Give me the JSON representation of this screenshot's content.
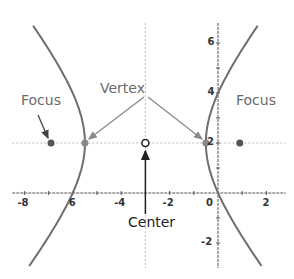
{
  "diagram": {
    "equation": {
      "h": -3,
      "k": 2,
      "a": 2.5,
      "b": 3,
      "orientation": "horizontal"
    },
    "axes": {
      "x_ticks": [
        {
          "value": -8,
          "label": "-8"
        },
        {
          "value": -6,
          "label": "6"
        },
        {
          "value": -4,
          "label": "-4"
        },
        {
          "value": -2,
          "label": "-2"
        },
        {
          "value": 0,
          "label": "0"
        },
        {
          "value": 2,
          "label": "2"
        }
      ],
      "y_ticks": [
        {
          "value": 6,
          "label": "6"
        },
        {
          "value": 4,
          "label": "4"
        },
        {
          "value": 2,
          "label": "2"
        },
        {
          "value": -2,
          "label": "-2"
        }
      ],
      "x_range": [
        -8.5,
        2.8
      ],
      "y_range": [
        -3.0,
        6.8
      ]
    },
    "points": {
      "focus_left": {
        "x": -6.9,
        "y": 2
      },
      "vertex_left": {
        "x": -5.5,
        "y": 2
      },
      "center": {
        "x": -3,
        "y": 2
      },
      "vertex_right": {
        "x": -0.5,
        "y": 2
      },
      "focus_right": {
        "x": 0.9,
        "y": 2
      }
    },
    "labels": {
      "focus_left": "Focus",
      "focus_right": "Focus",
      "vertex": "Vertex",
      "center": "Center"
    },
    "colors": {
      "curve": "#6e6e6e",
      "axis": "#555555",
      "guide": "#bbbbbb",
      "focus_point": "#555555",
      "vertex_point": "#888888",
      "arrow_gray": "#8a8a8a",
      "arrow_dark": "#222222"
    }
  }
}
